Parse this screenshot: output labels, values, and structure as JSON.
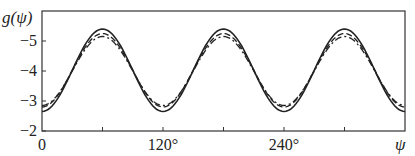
{
  "chart_data": {
    "type": "line",
    "title": "",
    "xlabel": "ψ",
    "ylabel": "g(ψ)",
    "xlim": [
      0,
      360
    ],
    "ylim": [
      -2,
      -6
    ],
    "y_inverted": true,
    "x_ticks": [
      0,
      60,
      120,
      180,
      240,
      300
    ],
    "x_tick_labels": [
      "0",
      "",
      "120°",
      "",
      "240°",
      ""
    ],
    "y_ticks": [
      -2,
      -3,
      -4,
      -5
    ],
    "y_tick_labels": [
      "−2",
      "−3",
      "−4",
      "−5"
    ],
    "grid": false,
    "legend": null,
    "series": [
      {
        "name": "solid",
        "style": "solid",
        "period_deg": 120,
        "peak_at_deg": 60,
        "max": -5.4,
        "min": -2.65
      },
      {
        "name": "dashed",
        "style": "dashed",
        "period_deg": 120,
        "peak_at_deg": 60,
        "max": -5.25,
        "min": -2.8
      },
      {
        "name": "dash-dot",
        "style": "dashdot",
        "period_deg": 120,
        "peak_at_deg": 60,
        "max": -5.15,
        "min": -2.85
      }
    ]
  },
  "labels": {
    "ylabel": "g(ψ)",
    "xlabel": "ψ",
    "x0": "0",
    "x120": "120°",
    "x240": "240°",
    "y2": "−2",
    "y3": "−3",
    "y4": "−4",
    "y5": "−5"
  }
}
